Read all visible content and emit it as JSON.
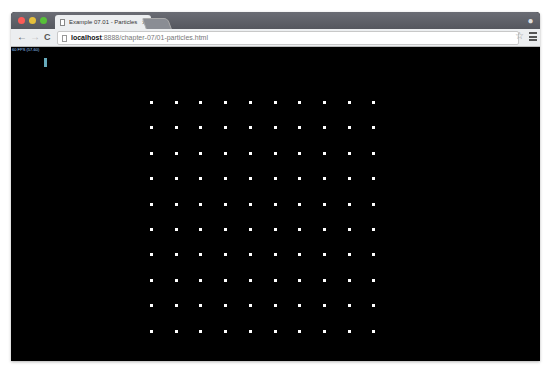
{
  "browser": {
    "tab_title": "Example 07.01 - Particles",
    "tab_close": "×",
    "url_host": "localhost",
    "url_path": ":8888/chapter-07/01-particles.html",
    "back_icon": "←",
    "forward_icon": "→",
    "reload_icon": "C",
    "star_icon": "☆",
    "profile_icon": "👤",
    "traffic_lights": {
      "close": "#fc5b57",
      "minimize": "#e5bf3c",
      "zoom": "#57c038"
    }
  },
  "stats": {
    "fps_text": "60 FPS (57-60)"
  },
  "scene": {
    "particle_color": "#ffffff",
    "background": "#000000",
    "grid_columns": 10,
    "grid_rows": 10
  }
}
